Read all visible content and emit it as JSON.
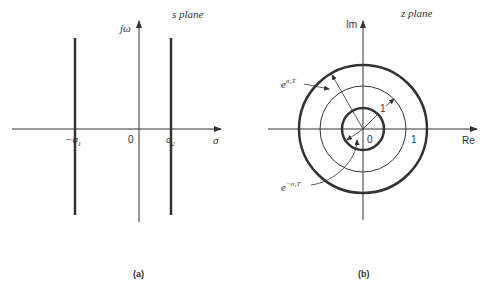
{
  "panel_a": {
    "title": "s plane",
    "vertical_axis_label": "jω",
    "horizontal_axis_label": "σ",
    "origin_label": "0",
    "tick_left_label": "−σ",
    "tick_left_sub": "1",
    "tick_right_label": "σ",
    "tick_right_sub": "2",
    "caption": "(a)",
    "vertical_lines": [
      {
        "name": "-sigma1",
        "x_label": "−σ₁"
      },
      {
        "name": "sigma2",
        "x_label": "σ₂"
      }
    ]
  },
  "panel_b": {
    "title": "z plane",
    "vertical_axis_label": "Im",
    "horizontal_axis_label": "Re",
    "origin_label": "0",
    "unit_label_axis": "1",
    "unit_label_radius": "1",
    "outer_radius_label_base": "e",
    "outer_radius_label_sup": "σ₂T",
    "inner_radius_label_base": "e",
    "inner_radius_label_sup": "−σ₁T",
    "caption": "(b)",
    "circles": [
      {
        "name": "inner",
        "label": "e^{−σ₁T}"
      },
      {
        "name": "unit",
        "label": "1"
      },
      {
        "name": "outer",
        "label": "e^{σ₂T}"
      }
    ]
  },
  "colors": {
    "ink": "#333333",
    "background": "#ffffff"
  }
}
